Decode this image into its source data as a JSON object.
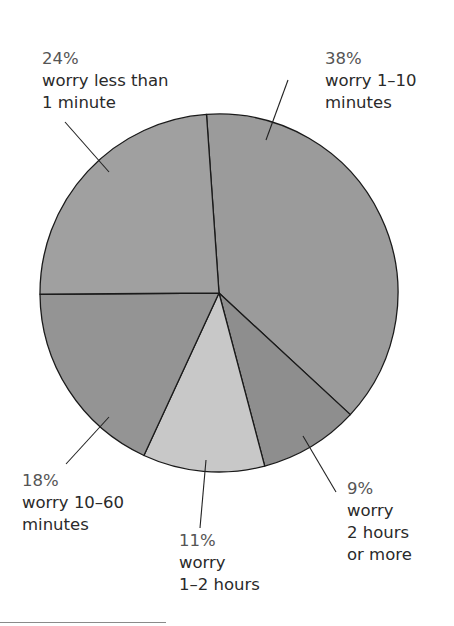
{
  "chart_data": {
    "type": "pie",
    "title": "",
    "start_angle_deg": -4,
    "direction": "clockwise",
    "center": [
      219,
      293
    ],
    "radius": 179,
    "slices": [
      {
        "label": "worry 1–10 minutes",
        "value": 38,
        "pct_text": "38%",
        "lines": [
          "worry 1–10",
          "minutes"
        ],
        "color": "#9b9b9b"
      },
      {
        "label": "worry 2 hours or more",
        "value": 9,
        "pct_text": "9%",
        "lines": [
          "worry",
          "2 hours",
          "or more"
        ],
        "color": "#8e8e8e"
      },
      {
        "label": "worry 1–2 hours",
        "value": 11,
        "pct_text": "11%",
        "lines": [
          "worry",
          "1–2 hours"
        ],
        "color": "#c8c8c8"
      },
      {
        "label": "worry 10–60 minutes",
        "value": 18,
        "pct_text": "18%",
        "lines": [
          "worry 10–60",
          "minutes"
        ],
        "color": "#949494"
      },
      {
        "label": "worry less than 1 minute",
        "value": 24,
        "pct_text": "24%",
        "lines": [
          "worry less than",
          "1 minute"
        ],
        "color": "#a0a0a0"
      }
    ],
    "labels_layout": [
      {
        "x": 325,
        "y": 48,
        "leader": [
          [
            288,
            80
          ],
          [
            266,
            140
          ]
        ]
      },
      {
        "x": 347,
        "y": 478,
        "leader": [
          [
            303,
            436
          ],
          [
            336,
            492
          ]
        ]
      },
      {
        "x": 179,
        "y": 530,
        "leader": [
          [
            206,
            460
          ],
          [
            200,
            528
          ]
        ]
      },
      {
        "x": 22,
        "y": 470,
        "leader": [
          [
            109,
            417
          ],
          [
            66,
            464
          ]
        ]
      },
      {
        "x": 42,
        "y": 48,
        "leader": [
          [
            65,
            122
          ],
          [
            109,
            172
          ]
        ]
      }
    ],
    "legend": "none",
    "stroke_color": "#1a1a1a"
  }
}
